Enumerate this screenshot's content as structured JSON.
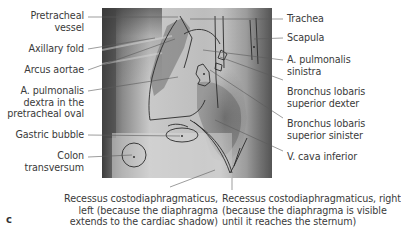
{
  "figure": {
    "panel_letter": "c",
    "image_description": "Lateral chest radiograph with anatomical overlay outlines"
  },
  "labels_left": [
    {
      "lines": [
        "Pretracheal",
        "vessel"
      ]
    },
    {
      "lines": [
        "Axillary fold"
      ]
    },
    {
      "lines": [
        "Arcus aortae"
      ]
    },
    {
      "lines": [
        "A. pulmonalis",
        "dextra in the",
        "pretracheal oval"
      ]
    },
    {
      "lines": [
        "Gastric bubble"
      ]
    },
    {
      "lines": [
        "Colon",
        "transversum"
      ]
    }
  ],
  "labels_right": [
    {
      "lines": [
        "Trachea"
      ]
    },
    {
      "lines": [
        "Scapula"
      ]
    },
    {
      "lines": [
        "A. pulmonalis",
        "sinistra"
      ]
    },
    {
      "lines": [
        "Bronchus lobaris",
        "superior dexter"
      ]
    },
    {
      "lines": [
        "Bronchus lobaris",
        "superior sinister"
      ]
    },
    {
      "lines": [
        "V. cava inferior"
      ]
    }
  ],
  "labels_bottom": [
    {
      "lines": [
        "Recessus costodiaphragmaticus,",
        "left (because the diaphragma",
        "extends to the cardiac shadow)"
      ]
    },
    {
      "lines": [
        "Recessus costodiaphragmaticus, right",
        "(because the diaphragma is visible",
        "until it reaches the sternum)"
      ]
    }
  ],
  "colors": {
    "leader_line": "#555555",
    "outline": "#2a2a2a",
    "text": "#3a3a3a"
  }
}
